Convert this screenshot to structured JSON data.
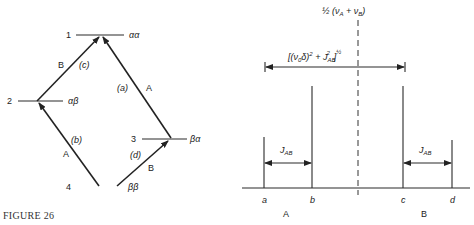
{
  "figure": {
    "caption": "FIGURE 26"
  },
  "energy_diagram": {
    "levels": [
      {
        "number": "1",
        "state": "αα"
      },
      {
        "number": "2",
        "state": "αβ"
      },
      {
        "number": "3",
        "state": "βα"
      },
      {
        "number": "4",
        "state": "ββ"
      }
    ],
    "transitions": [
      {
        "id": "(a)",
        "nucleus": "A",
        "from": "3",
        "to": "1"
      },
      {
        "id": "(b)",
        "nucleus": "A",
        "from": "4",
        "to": "2"
      },
      {
        "id": "(c)",
        "nucleus": "B",
        "from": "2",
        "to": "1"
      },
      {
        "id": "(d)",
        "nucleus": "B",
        "from": "4",
        "to": "3"
      }
    ]
  },
  "spectrum": {
    "center_label": {
      "prefix": "½ (ν",
      "sub_a": "A",
      "plus": " + ν",
      "sub_b": "B",
      "suffix": ")"
    },
    "span_label": {
      "part1": "[(ν",
      "sub0": "0",
      "part2": "δ)",
      "sup2": "2",
      "part3": " + J",
      "subAB": "AB",
      "sup2b": "2",
      "part4": "]",
      "supHalf": "½"
    },
    "coupling_label": {
      "main": "J",
      "sub": "AB"
    },
    "lines": [
      {
        "label": "a",
        "relative_intensity": 0.5
      },
      {
        "label": "b",
        "relative_intensity": 1.0
      },
      {
        "label": "c",
        "relative_intensity": 1.0
      },
      {
        "label": "d",
        "relative_intensity": 0.47
      }
    ],
    "groups": [
      {
        "label": "A"
      },
      {
        "label": "B"
      }
    ]
  }
}
